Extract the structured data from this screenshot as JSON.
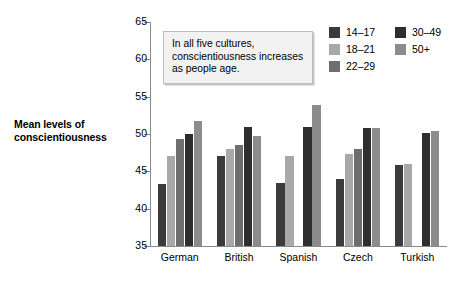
{
  "chart_data": {
    "type": "bar",
    "title": "",
    "subtitle": "",
    "xlabel": "",
    "ylabel": "Mean levels of conscientiousness",
    "ylim": [
      35,
      65
    ],
    "ytick_step": 5,
    "yticks": [
      35,
      40,
      45,
      50,
      55,
      60,
      65
    ],
    "grid": false,
    "legend_position": "top-right",
    "categories": [
      "German",
      "British",
      "Spanish",
      "Czech",
      "Turkish"
    ],
    "series": [
      {
        "name": "14–17",
        "color": "#3b3b3b",
        "values": [
          43.3,
          47.0,
          43.5,
          44.0,
          45.9
        ]
      },
      {
        "name": "18–21",
        "color": "#a8a8a8",
        "values": [
          47.0,
          48.0,
          47.0,
          47.3,
          46.0
        ]
      },
      {
        "name": "22–29",
        "color": "#6e6e6e",
        "values": [
          49.3,
          48.5,
          null,
          48.0,
          null
        ]
      },
      {
        "name": "30–49",
        "color": "#2e2e2e",
        "values": [
          50.0,
          51.0,
          51.0,
          50.8,
          50.2
        ]
      },
      {
        "name": "50+",
        "color": "#8c8c8c",
        "values": [
          51.7,
          49.8,
          53.9,
          50.8,
          50.4
        ]
      }
    ],
    "annotation": "In all five cultures, conscientiousness increases as people age."
  },
  "axis": {
    "y_title": "Mean levels of conscientiousness",
    "tick_labels": [
      "65",
      "60",
      "55",
      "50",
      "45",
      "40",
      "35"
    ]
  },
  "legend": {
    "column_a": [
      {
        "label": "14–17",
        "color": "#3b3b3b"
      },
      {
        "label": "18–21",
        "color": "#a8a8a8"
      },
      {
        "label": "22–29",
        "color": "#6e6e6e"
      }
    ],
    "column_b": [
      {
        "label": "30–49",
        "color": "#2e2e2e"
      },
      {
        "label": "50+",
        "color": "#8c8c8c"
      }
    ]
  },
  "annotation": {
    "text": "In all five cultures, conscientiousness increases as people age."
  },
  "colors": {
    "axis": "#8a8a8a",
    "annotation_bg": "#f2f2f2",
    "annotation_border": "#bdbdbd",
    "background": "#ffffff"
  }
}
